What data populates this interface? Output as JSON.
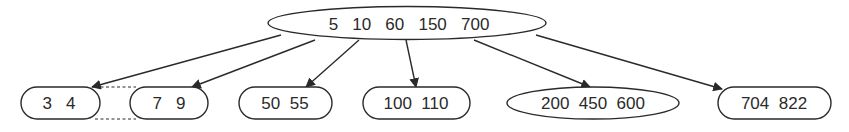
{
  "tree": {
    "root": {
      "keys": [
        "5",
        "10",
        "60",
        "150",
        "700"
      ],
      "label": "5   10   60   150   700"
    },
    "leaves": [
      {
        "keys": [
          "3",
          "4"
        ],
        "label": "3   4"
      },
      {
        "keys": [
          "7",
          "9"
        ],
        "label": "7   9"
      },
      {
        "keys": [
          "50",
          "55"
        ],
        "label": "50  55"
      },
      {
        "keys": [
          "100",
          "110"
        ],
        "label": "100  110"
      },
      {
        "keys": [
          "200",
          "450",
          "600"
        ],
        "label": "200  450  600"
      },
      {
        "keys": [
          "704",
          "822"
        ],
        "label": "704  822"
      }
    ],
    "edges": [
      {
        "from": "root",
        "to": "leaf-0"
      },
      {
        "from": "root",
        "to": "leaf-1"
      },
      {
        "from": "root",
        "to": "leaf-2"
      },
      {
        "from": "root",
        "to": "leaf-3"
      },
      {
        "from": "root",
        "to": "leaf-4"
      },
      {
        "from": "root",
        "to": "leaf-5"
      }
    ],
    "dashed_link": {
      "between": [
        "leaf-0",
        "leaf-1"
      ]
    }
  },
  "colors": {
    "stroke": "#2a2a2a",
    "background": "#ffffff",
    "text": "#2a2a2a"
  }
}
